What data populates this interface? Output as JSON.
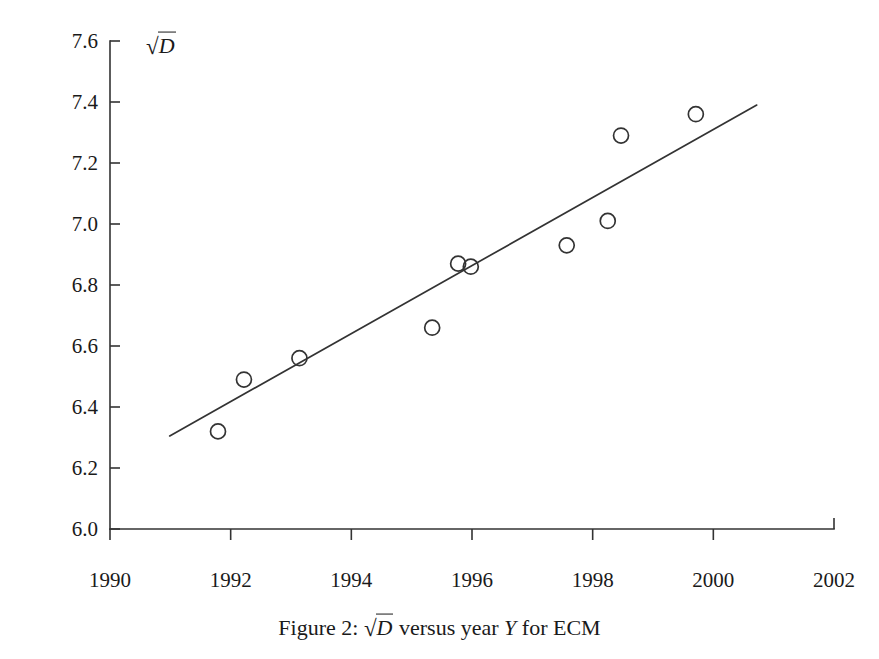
{
  "figure": {
    "caption_prefix": "Figure 2:",
    "caption_middle": "versus year",
    "caption_suffix": "for ECM",
    "caption_var_y": "Y",
    "caption_full": "Figure 2: √D versus year Y for ECM"
  },
  "chart_data": {
    "type": "scatter",
    "title": "",
    "xlabel": "",
    "ylabel": "√D",
    "ylabel_radical": "√",
    "ylabel_radicand": "D",
    "xlim": [
      1990,
      2002
    ],
    "ylim": [
      6.0,
      7.6
    ],
    "grid": false,
    "legend": null,
    "xticks": [
      1990,
      1992,
      1994,
      1996,
      1998,
      2000,
      2002
    ],
    "xtick_labels": [
      "1990",
      "1992",
      "1994",
      "1996",
      "1998",
      "2000",
      "2002"
    ],
    "yticks": [
      6.0,
      6.2,
      6.4,
      6.6,
      6.8,
      7.0,
      7.2,
      7.4,
      7.6
    ],
    "ytick_labels": [
      "6.0",
      "6.2",
      "6.4",
      "6.6",
      "6.8",
      "7.0",
      "7.2",
      "7.4",
      "7.6"
    ],
    "marker": "open-circle",
    "marker_color": "#333333",
    "line_color": "#333333",
    "points": [
      {
        "x": 1991.79,
        "y": 6.32
      },
      {
        "x": 1992.22,
        "y": 6.49
      },
      {
        "x": 1993.14,
        "y": 6.56
      },
      {
        "x": 1995.34,
        "y": 6.66
      },
      {
        "x": 1995.77,
        "y": 6.87
      },
      {
        "x": 1995.98,
        "y": 6.86
      },
      {
        "x": 1997.57,
        "y": 6.93
      },
      {
        "x": 1998.25,
        "y": 7.01
      },
      {
        "x": 1998.47,
        "y": 7.29
      },
      {
        "x": 1999.71,
        "y": 7.36
      }
    ],
    "series": [
      {
        "name": "sqrt(D) observations",
        "x": [
          1991.79,
          1992.22,
          1993.14,
          1995.34,
          1995.77,
          1995.98,
          1997.57,
          1998.25,
          1998.47,
          1999.71
        ],
        "values": [
          6.32,
          6.49,
          6.56,
          6.66,
          6.87,
          6.86,
          6.93,
          7.01,
          7.29,
          7.36
        ]
      },
      {
        "name": "fitted trend line",
        "x": [
          1990.99,
          2000.72
        ],
        "values": [
          6.305,
          7.39
        ]
      }
    ],
    "trend_line": {
      "x_start": 1990.99,
      "y_start": 6.305,
      "x_end": 2000.72,
      "y_end": 7.39
    }
  }
}
